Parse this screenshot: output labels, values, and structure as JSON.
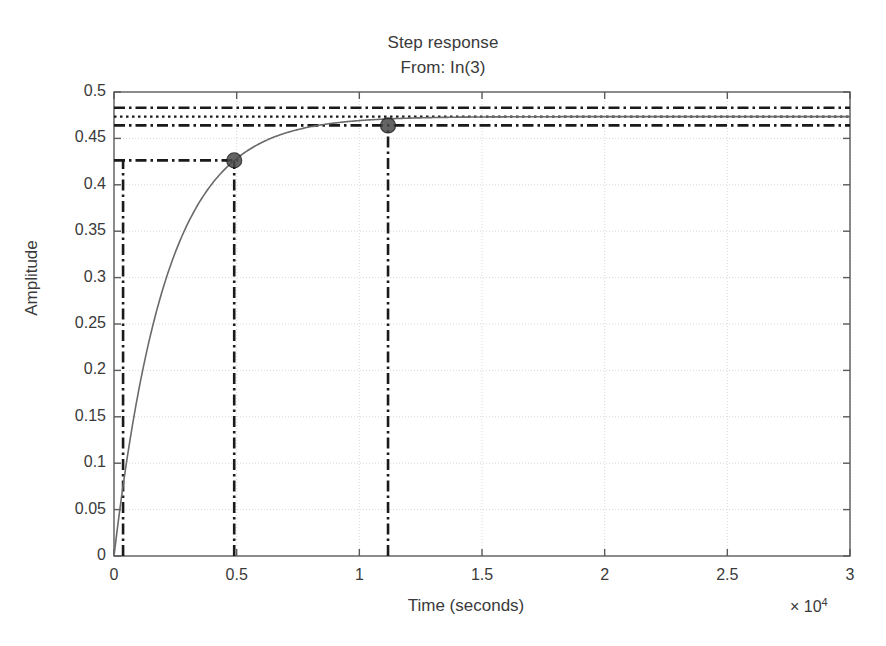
{
  "figure": {
    "title": "Step response",
    "subtitle": "From: In(3)",
    "xlabel": "Time (seconds)",
    "ylabel": "Amplitude",
    "x_exponent_prefix": "× 10",
    "x_exponent_power": "4",
    "background": "#ffffff",
    "axis_color": "#5a5a5a",
    "curve_color": "#6a6a6a",
    "marker_color": "#4a4a4a",
    "annotation_color": "#1a1a1a",
    "grid_color": "#d9d9d9"
  },
  "chart_data": {
    "type": "line",
    "title": "Step response",
    "subtitle": "From: In(3)",
    "xlabel": "Time (seconds)",
    "ylabel": "Amplitude",
    "x_scale_factor": 10000,
    "xlim": [
      0,
      30000
    ],
    "ylim": [
      0,
      0.5
    ],
    "xticks": [
      0,
      5000,
      10000,
      15000,
      20000,
      25000,
      30000
    ],
    "xtick_labels": [
      "0",
      "0.5",
      "1",
      "1.5",
      "2",
      "2.5",
      "3"
    ],
    "yticks": [
      0,
      0.05,
      0.1,
      0.15,
      0.2,
      0.25,
      0.3,
      0.35,
      0.4,
      0.45,
      0.5
    ],
    "ytick_labels": [
      "0",
      "0.05",
      "0.1",
      "0.15",
      "0.2",
      "0.25",
      "0.3",
      "0.35",
      "0.4",
      "0.45",
      "0.5"
    ],
    "grid": true,
    "legend": false,
    "series": [
      {
        "name": "Step response",
        "style": "solid",
        "model": "first-order",
        "steady_state": 0.4735,
        "time_constant": 2128,
        "x": [
          0,
          250,
          500,
          750,
          1000,
          1500,
          2000,
          2500,
          3000,
          3500,
          4000,
          4500,
          4900,
          5500,
          6000,
          7000,
          8000,
          9000,
          10000,
          11170,
          12000,
          14000,
          16000,
          18000,
          20000,
          22000,
          24000,
          26000,
          28000,
          30000
        ],
        "y": [
          0.0,
          0.0527,
          0.1,
          0.1423,
          0.1802,
          0.2447,
          0.2962,
          0.3373,
          0.3701,
          0.3963,
          0.4172,
          0.4339,
          0.4448,
          0.4563,
          0.4631,
          0.4667,
          0.4713,
          0.4728,
          0.4731,
          0.4734,
          0.4735,
          0.4735,
          0.4735,
          0.4735,
          0.4735,
          0.4735,
          0.4735,
          0.4735,
          0.4735,
          0.4735
        ]
      }
    ],
    "reference_lines": [
      {
        "name": "settling-band-upper",
        "orientation": "horizontal",
        "value": 0.483,
        "style": "dash-dot"
      },
      {
        "name": "steady-state",
        "orientation": "horizontal",
        "value": 0.4735,
        "style": "dotted"
      },
      {
        "name": "settling-band-lower",
        "orientation": "horizontal",
        "value": 0.464,
        "style": "dash-dot"
      },
      {
        "name": "rise-time-level",
        "orientation": "horizontal",
        "value": 0.4263,
        "style": "dash-dot"
      },
      {
        "name": "rise-start",
        "orientation": "vertical",
        "value": 370,
        "style": "dash-dot"
      },
      {
        "name": "rise-end",
        "orientation": "vertical",
        "value": 4900,
        "style": "dash-dot"
      },
      {
        "name": "settling-time",
        "orientation": "vertical",
        "value": 11170,
        "style": "dash-dot"
      }
    ],
    "markers": [
      {
        "name": "rise-time-marker",
        "x": 4900,
        "y": 0.4263,
        "shape": "circle"
      },
      {
        "name": "settling-time-marker",
        "x": 11170,
        "y": 0.464,
        "shape": "circle"
      }
    ]
  }
}
